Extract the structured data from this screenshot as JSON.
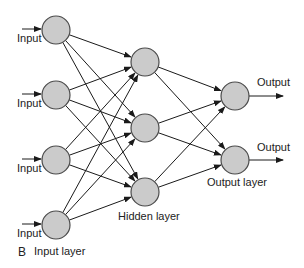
{
  "figure": {
    "letter": "B",
    "colors": {
      "node_fill": "#cbcbcb",
      "node_stroke": "#4a4a4a",
      "edge": "#1a1a1a",
      "background": "#ffffff"
    }
  },
  "layers": {
    "input": {
      "label": "Input layer",
      "node_label": "Input",
      "count": 4,
      "nodes": [
        {
          "x": 56,
          "y": 30
        },
        {
          "x": 56,
          "y": 95
        },
        {
          "x": 56,
          "y": 160
        },
        {
          "x": 56,
          "y": 225
        }
      ]
    },
    "hidden": {
      "label": "Hidden layer",
      "count": 3,
      "nodes": [
        {
          "x": 145,
          "y": 62
        },
        {
          "x": 145,
          "y": 128
        },
        {
          "x": 145,
          "y": 192
        }
      ]
    },
    "output": {
      "label": "Output layer",
      "node_label": "Output",
      "count": 2,
      "nodes": [
        {
          "x": 235,
          "y": 96
        },
        {
          "x": 235,
          "y": 160
        }
      ]
    }
  },
  "labels": {
    "input_1": "Input",
    "input_2": "Input",
    "input_3": "Input",
    "input_4": "Input",
    "output_1": "Output",
    "output_2": "Output",
    "input_layer": "Input layer",
    "hidden_layer": "Hidden layer",
    "output_layer": "Output layer",
    "figure_letter": "B"
  }
}
